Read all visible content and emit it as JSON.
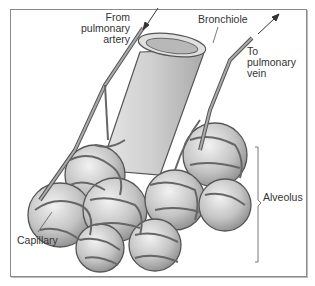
{
  "figure": {
    "labels": {
      "artery": [
        "From",
        "pulmonary",
        "artery"
      ],
      "bronchiole": "Bronchiole",
      "vein": [
        "To",
        "pulmonary",
        "vein"
      ],
      "alveolus": "Alveolus",
      "capillary": "Capillary"
    }
  }
}
